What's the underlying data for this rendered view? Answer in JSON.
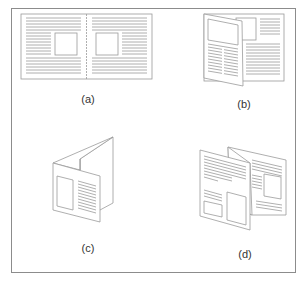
{
  "figure": {
    "panels": [
      {
        "id": "a",
        "label": "(a)",
        "description": "open two-page spread"
      },
      {
        "id": "b",
        "label": "(b)",
        "description": "single fold, front flap partially open"
      },
      {
        "id": "c",
        "label": "(c)",
        "description": "zig-zag fold, standing"
      },
      {
        "id": "d",
        "label": "(d)",
        "description": "accordion fold, open"
      }
    ],
    "colors": {
      "line": "#8c8c8c",
      "text": "#333333",
      "background": "#ffffff"
    }
  }
}
